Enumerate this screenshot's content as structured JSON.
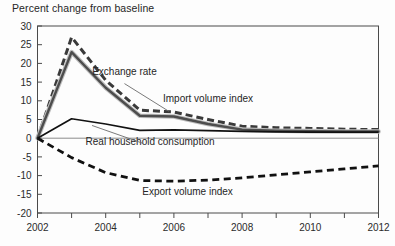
{
  "chart_data": {
    "type": "line",
    "title": "Percent change from baseline",
    "xlabel": "",
    "ylabel": "",
    "xlim": [
      2002,
      2012
    ],
    "ylim": [
      -20,
      30
    ],
    "ytick_step": 5,
    "xtick_step": 1,
    "grid": false,
    "legend_position": "inline-annotations",
    "y_ticks": [
      30,
      25,
      20,
      15,
      10,
      5,
      0,
      -5,
      -10,
      -15,
      -20
    ],
    "y_tick_labels": [
      "30",
      "25",
      "20",
      "15",
      "10",
      "5",
      "0",
      "-5",
      "-10",
      "-15",
      "-20"
    ],
    "x_ticks": [
      2002,
      2003,
      2004,
      2005,
      2006,
      2007,
      2008,
      2009,
      2010,
      2011,
      2012
    ],
    "x_tick_labels": [
      "2002",
      "",
      "2004",
      "",
      "2006",
      "",
      "2008",
      "",
      "2010",
      "",
      "2012"
    ],
    "x": [
      2002,
      2003,
      2004,
      2005,
      2006,
      2007,
      2008,
      2009,
      2010,
      2011,
      2012
    ],
    "series": [
      {
        "name": "Exchange rate",
        "style": "dashed",
        "color": "#3a3a3a",
        "values": [
          0,
          27.0,
          15.5,
          7.5,
          7.0,
          5.0,
          3.2,
          2.8,
          2.6,
          2.4,
          2.3
        ],
        "label_x": 2004.55,
        "label_y": 16.8
      },
      {
        "name": "Import volume index",
        "style": "solid-thick-gray",
        "color": "#4d4d4d",
        "values": [
          0,
          23.0,
          13.5,
          6.0,
          5.8,
          3.8,
          2.3,
          2.0,
          1.9,
          1.8,
          1.8
        ],
        "label_x": 2007.0,
        "label_y": 9.8
      },
      {
        "name": "Real household consumption",
        "style": "solid-black",
        "color": "#111111",
        "values": [
          0,
          5.2,
          3.8,
          2.1,
          2.2,
          2.0,
          1.8,
          1.7,
          1.6,
          1.6,
          1.6
        ],
        "label_x": 2005.3,
        "label_y": -1.9
      },
      {
        "name": "Export volume index",
        "style": "dashed-black",
        "color": "#111111",
        "values": [
          0,
          -5.2,
          -9.2,
          -11.3,
          -11.5,
          -11.2,
          -10.6,
          -9.8,
          -9.0,
          -8.2,
          -7.4
        ],
        "label_x": 2006.4,
        "label_y": -15.1
      }
    ],
    "annotations": [
      {
        "text": "Exchange rate",
        "leader_from": [
          2004.55,
          14.6
        ],
        "leader_to": [
          2005.85,
          7.2
        ]
      },
      {
        "text": "Import volume index",
        "leader_from": null,
        "leader_to": null
      },
      {
        "text": "Real household consumption",
        "leader_from": [
          2005.1,
          -1.4
        ],
        "leader_to": [
          2003.6,
          3.4
        ]
      },
      {
        "text": "Export volume index",
        "leader_from": null,
        "leader_to": null
      }
    ]
  },
  "axis": {
    "title": "Percent change from baseline"
  },
  "labels": {
    "exchange_rate": "Exchange rate",
    "import_volume_index": "Import volume index",
    "real_household_consumption": "Real household consumption",
    "export_volume_index": "Export volume index"
  }
}
